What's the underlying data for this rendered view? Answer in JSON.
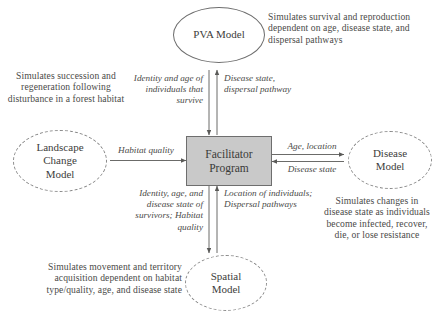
{
  "diagram": {
    "colors": {
      "center_box_fill": "#c9c9c9",
      "center_box_border": "#6e6e6e",
      "node_border_solid": "#6d6d6d",
      "node_border_dashed": "#8a8a8a",
      "text": "#4a4a48",
      "arrow": "#5a5a58"
    },
    "nodes": {
      "center": {
        "label_line1": "Facilitator",
        "label_line2": "Program",
        "shape": "rectangle",
        "fill": "#c9c9c9"
      },
      "pva": {
        "label_line1": "PVA Model",
        "label_line2": "",
        "shape": "ellipse",
        "border": "solid"
      },
      "landscape": {
        "label_line1": "Landscape",
        "label_line2": "Change",
        "label_line3": "Model",
        "shape": "ellipse",
        "border": "dashed"
      },
      "disease": {
        "label_line1": "Disease",
        "label_line2": "Model",
        "shape": "ellipse",
        "border": "dashed"
      },
      "spatial": {
        "label_line1": "Spatial",
        "label_line2": "Model",
        "shape": "ellipse",
        "border": "dashed"
      }
    },
    "descriptions": {
      "pva": "Simulates survival and reproduction dependent on age, disease state, and dispersal pathways",
      "landscape": "Simulates succession and regeneration following disturbance in a forest habitat",
      "disease": "Simulates changes in disease state as individuals become infected, recover, die, or lose resistance",
      "spatial": "Simulates movement and territory acquisition dependent on habitat type/quality, age, and disease state"
    },
    "edge_labels": {
      "pva_down": "Identity and age of individuals that survive",
      "pva_up": "Disease state, dispersal pathway",
      "landscape_in": "Habitat quality",
      "disease_out": "Age, location",
      "disease_in": "Disease state",
      "spatial_down": "Identity, age, and disease state of survivors; Habitat quality",
      "spatial_up": "Location of individuals; Dispersal pathways"
    }
  }
}
